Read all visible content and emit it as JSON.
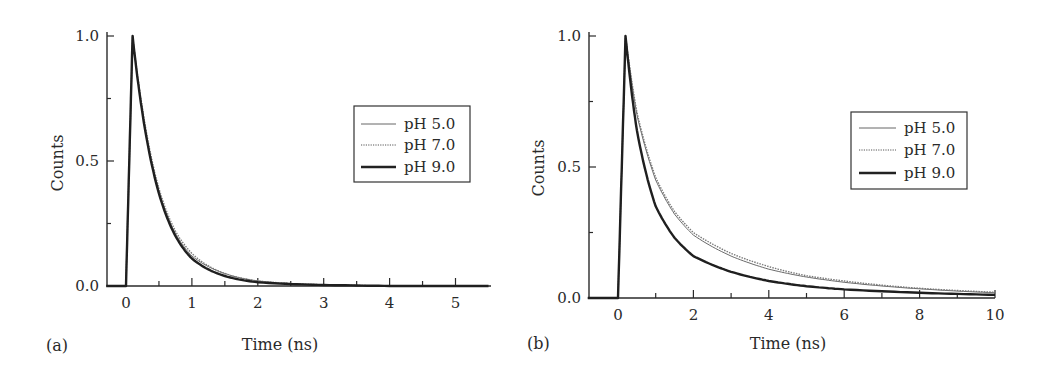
{
  "chart_data": [
    {
      "panel_label": "(a)",
      "type": "line",
      "title": "",
      "xlabel": "Time (ns)",
      "ylabel": "Counts",
      "xlim": [
        -0.3,
        5.5
      ],
      "ylim": [
        0.0,
        1.0
      ],
      "x_ticks": [
        "0",
        "1",
        "2",
        "3",
        "4",
        "5"
      ],
      "y_ticks": [
        "0.0",
        "0.5",
        "1.0"
      ],
      "grid": false,
      "legend_position": "upper right",
      "legend": [
        "pH 5.0",
        "pH 7.0",
        "pH 9.0"
      ],
      "series": [
        {
          "name": "pH 5.0",
          "style": "thin-solid",
          "peak_time_ns": 0.1,
          "decay_tau_ns": 0.42,
          "x": [
            -0.3,
            0.0,
            0.1,
            0.25,
            0.5,
            0.75,
            1.0,
            1.5,
            2.0,
            3.0,
            4.0,
            5.5
          ],
          "values": [
            0.0,
            0.0,
            1.0,
            0.7,
            0.38,
            0.21,
            0.12,
            0.05,
            0.02,
            0.005,
            0.0,
            0.0
          ]
        },
        {
          "name": "pH 7.0",
          "style": "dotted",
          "peak_time_ns": 0.1,
          "decay_tau_ns": 0.43,
          "x": [
            -0.3,
            0.0,
            0.1,
            0.25,
            0.5,
            0.75,
            1.0,
            1.5,
            2.0,
            3.0,
            4.0,
            5.5
          ],
          "values": [
            0.0,
            0.0,
            1.0,
            0.71,
            0.39,
            0.22,
            0.13,
            0.05,
            0.02,
            0.005,
            0.0,
            0.0
          ]
        },
        {
          "name": "pH 9.0",
          "style": "thick-solid",
          "peak_time_ns": 0.1,
          "decay_tau_ns": 0.41,
          "x": [
            -0.3,
            0.0,
            0.1,
            0.25,
            0.5,
            0.75,
            1.0,
            1.5,
            2.0,
            3.0,
            4.0,
            5.5
          ],
          "values": [
            0.0,
            0.0,
            1.0,
            0.69,
            0.37,
            0.2,
            0.11,
            0.04,
            0.015,
            0.004,
            0.0,
            0.0
          ]
        }
      ]
    },
    {
      "panel_label": "(b)",
      "type": "line",
      "title": "",
      "xlabel": "Time (ns)",
      "ylabel": "Counts",
      "xlim": [
        -0.8,
        10.0
      ],
      "ylim": [
        0.0,
        1.0
      ],
      "x_ticks": [
        "0",
        "2",
        "4",
        "6",
        "8",
        "10"
      ],
      "y_ticks": [
        "0.0",
        "0.5",
        "1.0"
      ],
      "grid": false,
      "legend_position": "upper right",
      "legend": [
        "pH 5.0",
        "pH 7.0",
        "pH 9.0"
      ],
      "series": [
        {
          "name": "pH 5.0",
          "style": "thin-solid",
          "x": [
            -0.8,
            0.0,
            0.2,
            0.5,
            1.0,
            1.5,
            2.0,
            3.0,
            4.0,
            5.0,
            6.0,
            8.0,
            10.0
          ],
          "values": [
            0.0,
            0.0,
            1.0,
            0.7,
            0.45,
            0.32,
            0.24,
            0.16,
            0.11,
            0.08,
            0.06,
            0.035,
            0.02
          ]
        },
        {
          "name": "pH 7.0",
          "style": "dotted",
          "x": [
            -0.8,
            0.0,
            0.2,
            0.5,
            1.0,
            1.5,
            2.0,
            3.0,
            4.0,
            5.0,
            6.0,
            8.0,
            10.0
          ],
          "values": [
            0.0,
            0.0,
            1.0,
            0.71,
            0.46,
            0.33,
            0.25,
            0.17,
            0.12,
            0.085,
            0.065,
            0.037,
            0.022
          ]
        },
        {
          "name": "pH 9.0",
          "style": "thick-solid",
          "x": [
            -0.8,
            0.0,
            0.2,
            0.5,
            1.0,
            1.5,
            2.0,
            3.0,
            4.0,
            5.0,
            6.0,
            8.0,
            10.0
          ],
          "values": [
            0.0,
            0.0,
            1.0,
            0.64,
            0.35,
            0.23,
            0.16,
            0.1,
            0.065,
            0.045,
            0.033,
            0.02,
            0.012
          ]
        }
      ]
    }
  ]
}
